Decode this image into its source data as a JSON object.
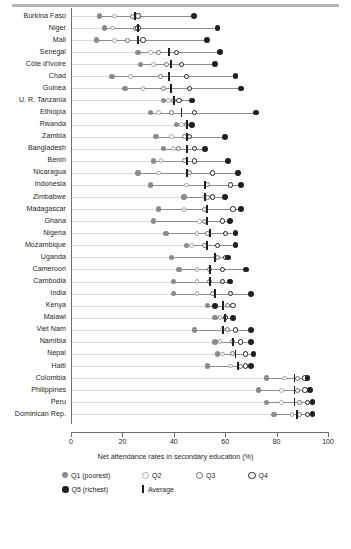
{
  "chart_data": {
    "type": "scatter",
    "title": "",
    "xlabel": "Net attendance rates in secondary education (%)",
    "ylabel": "",
    "xlim": [
      0,
      100
    ],
    "xticks": [
      "0",
      "20",
      "40",
      "60",
      "80",
      "100"
    ],
    "grid": true,
    "legend_position": "bottom",
    "series": [
      {
        "name": "Q1 (poorest)",
        "key": "q1",
        "marker": "filled-gray-circle",
        "color": "#8b8c8e"
      },
      {
        "name": "Q2",
        "key": "q2",
        "marker": "open-light-circle",
        "color": "#a7a9ac"
      },
      {
        "name": "Q3",
        "key": "q3",
        "marker": "open-mid-circle",
        "color": "#6d6e71"
      },
      {
        "name": "Q4",
        "key": "q4",
        "marker": "open-dark-circle",
        "color": "#231f20"
      },
      {
        "name": "Q5 (richest)",
        "key": "q5",
        "marker": "filled-black-circle",
        "color": "#231f20"
      },
      {
        "name": "Average",
        "key": "avg",
        "marker": "vertical-bar",
        "color": "#231f20"
      }
    ],
    "categories": [
      "Burkina Faso",
      "Niger",
      "Mali",
      "Senegal",
      "Côte d'Ivoire",
      "Chad",
      "Guinea",
      "U. R. Tanzania",
      "Ethiopia",
      "Rwanda",
      "Zambia",
      "Bangladesh",
      "Benin",
      "Nicaragua",
      "Indonesia",
      "Zimbabwe",
      "Madagascar",
      "Ghana",
      "Nigeria",
      "Mozambique",
      "Uganda",
      "Cameroon",
      "Cambodia",
      "India",
      "Kenya",
      "Malawi",
      "Viet Nam",
      "Namibia",
      "Nepal",
      "Haiti",
      "Colombia",
      "Philippines",
      "Peru",
      "Dominican Rep."
    ],
    "rows": [
      {
        "country": "Burkina Faso",
        "q1": 11,
        "q2": 17,
        "q3": 24,
        "q4": 26,
        "q5": 48,
        "avg": 25
      },
      {
        "country": "Niger",
        "q1": 13,
        "q2": 16,
        "q3": 25,
        "q4": 26,
        "q5": 57,
        "avg": 26
      },
      {
        "country": "Mali",
        "q1": 10,
        "q2": 17,
        "q3": 22,
        "q4": 28,
        "q5": 53,
        "avg": 26
      },
      {
        "country": "Senegal",
        "q1": 26,
        "q2": 31,
        "q3": 34,
        "q4": 41,
        "q5": 58,
        "avg": 38
      },
      {
        "country": "Côte d'Ivoire",
        "q1": 27,
        "q2": 32,
        "q3": 37,
        "q4": 43,
        "q5": 56,
        "avg": 39
      },
      {
        "country": "Chad",
        "q1": 16,
        "q2": 23,
        "q3": 35,
        "q4": 45,
        "q5": 64,
        "avg": 38
      },
      {
        "country": "Guinea",
        "q1": 21,
        "q2": 28,
        "q3": 36,
        "q4": 46,
        "q5": 66,
        "avg": 39
      },
      {
        "country": "U. R. Tanzania",
        "q1": 36,
        "q2": 38,
        "q3": 40,
        "q4": 42,
        "q5": 47,
        "avg": 40
      },
      {
        "country": "Ethiopia",
        "q1": 31,
        "q2": 34,
        "q3": 39,
        "q4": 48,
        "q5": 72,
        "avg": 43
      },
      {
        "country": "Rwanda",
        "q1": 41,
        "q2": 43,
        "q3": 45,
        "q4": 47,
        "q5": 47,
        "avg": 45
      },
      {
        "country": "Zambia",
        "q1": 33,
        "q2": 39,
        "q3": 44,
        "q4": 46,
        "q5": 60,
        "avg": 45
      },
      {
        "country": "Bangladesh",
        "q1": 36,
        "q2": 40,
        "q3": 42,
        "q4": 48,
        "q5": 52,
        "avg": 45
      },
      {
        "country": "Benin",
        "q1": 32,
        "q2": 35,
        "q3": 44,
        "q4": 48,
        "q5": 61,
        "avg": 45
      },
      {
        "country": "Nicaragua",
        "q1": 26,
        "q2": 34,
        "q3": 46,
        "q4": 55,
        "q5": 65,
        "avg": 45
      },
      {
        "country": "Indonesia",
        "q1": 31,
        "q2": 45,
        "q3": 53,
        "q4": 62,
        "q5": 66,
        "avg": 52
      },
      {
        "country": "Zimbabwe",
        "q1": 44,
        "q2": 52,
        "q3": 53,
        "q4": 55,
        "q5": 60,
        "avg": 52
      },
      {
        "country": "Madagascar",
        "q1": 34,
        "q2": 44,
        "q3": 52,
        "q4": 63,
        "q5": 66,
        "avg": 53
      },
      {
        "country": "Ghana",
        "q1": 32,
        "q2": 50,
        "q3": 52,
        "q4": 59,
        "q5": 62,
        "avg": 53
      },
      {
        "country": "Nigeria",
        "q1": 37,
        "q2": 49,
        "q3": 53,
        "q4": 60,
        "q5": 64,
        "avg": 54
      },
      {
        "country": "Mozambique",
        "q1": 45,
        "q2": 47,
        "q3": 52,
        "q4": 57,
        "q5": 64,
        "avg": 53
      },
      {
        "country": "Uganda",
        "q1": 39,
        "q2": 56,
        "q3": 57,
        "q4": 60,
        "q5": 61,
        "avg": 56
      },
      {
        "country": "Cameroon",
        "q1": 42,
        "q2": 49,
        "q3": 54,
        "q4": 59,
        "q5": 68,
        "avg": 54
      },
      {
        "country": "Cambodia",
        "q1": 40,
        "q2": 49,
        "q3": 54,
        "q4": 59,
        "q5": 62,
        "avg": 54
      },
      {
        "country": "India",
        "q1": 40,
        "q2": 49,
        "q3": 55,
        "q4": 62,
        "q5": 70,
        "avg": 56
      },
      {
        "country": "Kenya",
        "q1": 53,
        "q2": 56,
        "q3": 61,
        "q4": 63,
        "q5": 56,
        "avg": 59
      },
      {
        "country": "Malawi",
        "q1": 56,
        "q2": 58,
        "q3": 60,
        "q4": 60,
        "q5": 63,
        "avg": 60
      },
      {
        "country": "Viet Nam",
        "q1": 48,
        "q2": 59,
        "q3": 61,
        "q4": 64,
        "q5": 70,
        "avg": 59
      },
      {
        "country": "Namibia",
        "q1": 56,
        "q2": 58,
        "q3": 63,
        "q4": 66,
        "q5": 70,
        "avg": 63
      },
      {
        "country": "Nepal",
        "q1": 57,
        "q2": 59,
        "q3": 63,
        "q4": 68,
        "q5": 71,
        "avg": 64
      },
      {
        "country": "Haiti",
        "q1": 53,
        "q2": 62,
        "q3": 66,
        "q4": 68,
        "q5": 70,
        "avg": 65
      },
      {
        "country": "Colombia",
        "q1": 76,
        "q2": 83,
        "q3": 88,
        "q4": 91,
        "q5": 92,
        "avg": 87
      },
      {
        "country": "Philippines",
        "q1": 73,
        "q2": 82,
        "q3": 88,
        "q4": 91,
        "q5": 93,
        "avg": 87
      },
      {
        "country": "Peru",
        "q1": 76,
        "q2": 82,
        "q3": 89,
        "q4": 92,
        "q5": 94,
        "avg": 87
      },
      {
        "country": "Dominican Rep.",
        "q1": 79,
        "q2": 86,
        "q3": 89,
        "q4": 92,
        "q5": 94,
        "avg": 88
      }
    ]
  },
  "axis": {
    "x_title": "Net attendance rates in secondary education (%)",
    "ticks": [
      "0",
      "20",
      "40",
      "60",
      "80",
      "100"
    ]
  },
  "legend": {
    "items": [
      {
        "label": "Q1 (poorest)",
        "type": "q1"
      },
      {
        "label": "Q2",
        "type": "q2"
      },
      {
        "label": "Q3",
        "type": "q3"
      },
      {
        "label": "Q4",
        "type": "q4"
      },
      {
        "label": "Q5 (richest)",
        "type": "q5"
      },
      {
        "label": "Average",
        "type": "avg"
      }
    ]
  }
}
